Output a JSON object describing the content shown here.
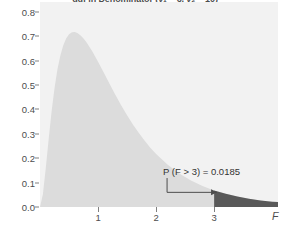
{
  "chart_data": {
    "type": "area",
    "title": "ddf in Denominator (ν₁ = 6, ν₂ = 10)",
    "xlabel": "F",
    "ylabel": "",
    "xlim": [
      0,
      4.1
    ],
    "ylim": [
      0,
      0.84
    ],
    "grid": false,
    "legend": null,
    "x_ticks": [
      {
        "value": 1,
        "label": "1"
      },
      {
        "value": 2,
        "label": "2"
      },
      {
        "value": 3,
        "label": "3"
      }
    ],
    "y_ticks": [
      {
        "value": 0.0,
        "label": "0.0"
      },
      {
        "value": 0.1,
        "label": "0.1"
      },
      {
        "value": 0.2,
        "label": "0.2"
      },
      {
        "value": 0.3,
        "label": "0.3"
      },
      {
        "value": 0.4,
        "label": "0.4"
      },
      {
        "value": 0.5,
        "label": "0.5"
      },
      {
        "value": 0.6,
        "label": "0.6"
      },
      {
        "value": 0.7,
        "label": "0.7"
      },
      {
        "value": 0.8,
        "label": "0.8"
      }
    ],
    "series": [
      {
        "name": "F density",
        "x": [
          0.0,
          0.05,
          0.1,
          0.15,
          0.2,
          0.25,
          0.3,
          0.35,
          0.4,
          0.45,
          0.5,
          0.55,
          0.6,
          0.65,
          0.7,
          0.75,
          0.8,
          0.9,
          1.0,
          1.1,
          1.2,
          1.3,
          1.4,
          1.5,
          1.6,
          1.7,
          1.8,
          1.9,
          2.0,
          2.2,
          2.4,
          2.6,
          2.8,
          3.0,
          3.2,
          3.4,
          3.6,
          3.8,
          4.0,
          4.1
        ],
        "y": [
          0.0,
          0.052,
          0.16,
          0.28,
          0.392,
          0.487,
          0.563,
          0.62,
          0.662,
          0.69,
          0.708,
          0.716,
          0.717,
          0.712,
          0.703,
          0.69,
          0.675,
          0.638,
          0.595,
          0.55,
          0.504,
          0.459,
          0.416,
          0.376,
          0.338,
          0.304,
          0.272,
          0.243,
          0.217,
          0.173,
          0.137,
          0.109,
          0.086,
          0.068,
          0.054,
          0.043,
          0.034,
          0.027,
          0.022,
          0.02
        ]
      }
    ],
    "shaded_region": {
      "label": "upper tail",
      "from": 3.0,
      "to": 4.1,
      "color": "#595959"
    },
    "annotations": [
      {
        "name": "tail-probability",
        "text_prefix": "P",
        "text_open": "(",
        "text_var": "F",
        "text_op": " > 3",
        "text_close": ")",
        "text_equals": " = 0.0185",
        "full_text": "P (F > 3) = 0.0185",
        "x": 2.12,
        "y": 0.135
      }
    ],
    "colors": {
      "panel_background": "#f2f2f2",
      "curve_fill": "#dcdcdc",
      "tail_fill": "#595959",
      "axis_text": "#4d4d4d",
      "annotation_text": "#333333",
      "tick_mark": "#808080",
      "leader_line": "#4d4d4d"
    }
  }
}
